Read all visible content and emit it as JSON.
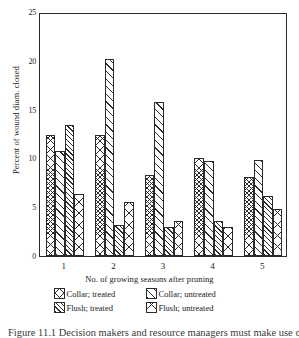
{
  "chart_data": {
    "type": "bar",
    "title": "",
    "xlabel": "No. of growing seasons after pruning",
    "ylabel": "Percent of wound diam. closed",
    "categories": [
      "1",
      "2",
      "3",
      "4",
      "5"
    ],
    "ylim": [
      0,
      25
    ],
    "yticks": [
      0,
      5,
      10,
      15,
      20,
      25
    ],
    "grid": false,
    "legend_position": "below",
    "series": [
      {
        "name": "Collar; treated",
        "pattern": "cross-hatch",
        "values": [
          12.4,
          12.4,
          8.3,
          10.0,
          8.1
        ]
      },
      {
        "name": "Collar; untreated",
        "pattern": "sparse-diagonal",
        "values": [
          10.8,
          20.2,
          15.8,
          9.7,
          9.8
        ]
      },
      {
        "name": "Flush; treated",
        "pattern": "dense-diagonal",
        "values": [
          13.4,
          3.2,
          3.0,
          3.6,
          6.2
        ]
      },
      {
        "name": "Flush; untreated",
        "pattern": "wide-cross",
        "values": [
          6.4,
          5.5,
          3.6,
          3.0,
          4.8
        ]
      }
    ]
  },
  "axis": {
    "y_title": "Percent of wound diam. closed",
    "x_title": "No. of growing seasons after pruning",
    "y_tick_labels": [
      "0",
      "5",
      "10",
      "15",
      "20",
      "25"
    ],
    "x_tick_labels": [
      "1",
      "2",
      "3",
      "4",
      "5"
    ]
  },
  "legend": {
    "items": [
      {
        "label": "Collar; treated"
      },
      {
        "label": "Collar; untreated"
      },
      {
        "label": "Flush; treated"
      },
      {
        "label": "Flush; untreated"
      }
    ]
  },
  "caption": {
    "text": "Figure 11.1  Decision makers and resource managers must make use of"
  },
  "colors": {
    "ink": "#2b2b2b",
    "background": "#ffffff"
  }
}
